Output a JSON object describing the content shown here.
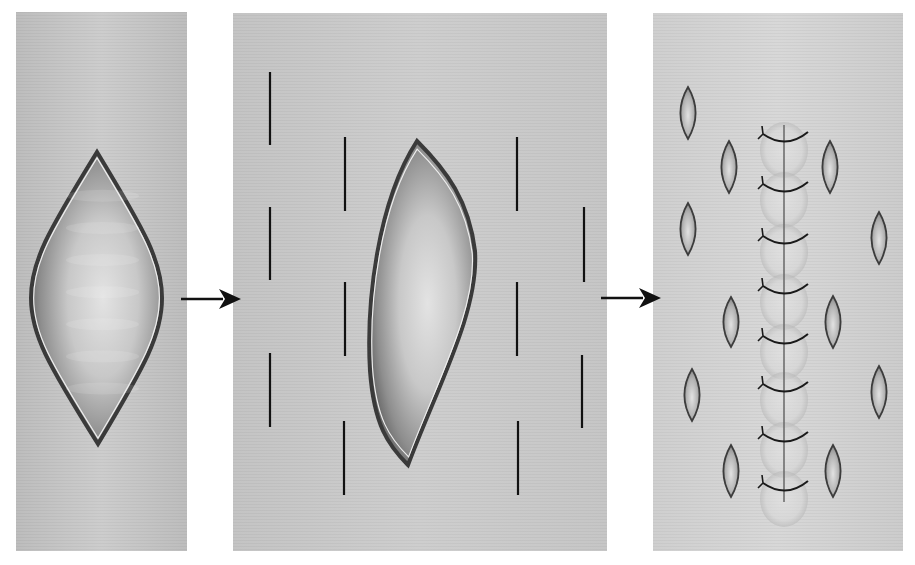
{
  "figure": {
    "colors": {
      "skin": "#c9c9c9",
      "skin_light": "#d3d3d3",
      "wound_edge": "#3a3a3a",
      "wound_inner": "#e0e0e0",
      "incision": "#111111",
      "suture": "#1a1a1a",
      "arrow": "#111111"
    }
  },
  "panels": [
    {
      "id": "step-1",
      "label": "open-wound",
      "x": 16,
      "y": 12,
      "w": 171,
      "h": 539
    },
    {
      "id": "step-2",
      "label": "relaxing-incisions",
      "x": 233,
      "y": 13,
      "w": 374,
      "h": 538
    },
    {
      "id": "step-3",
      "label": "closed-wound",
      "x": 653,
      "y": 13,
      "w": 250,
      "h": 538
    }
  ],
  "arrows": [
    {
      "id": "arrow-1",
      "x1": 181,
      "x2": 241,
      "y": 299
    },
    {
      "id": "arrow-2",
      "x1": 601,
      "x2": 661,
      "y": 298
    }
  ],
  "wound_1": {
    "top": [
      97,
      152
    ],
    "bottom": [
      98,
      444
    ],
    "left": 31,
    "right": 162
  },
  "wound_2": {
    "top": [
      417,
      141
    ],
    "bottom": [
      408,
      465
    ],
    "left": 368,
    "right": 475
  },
  "incisions": [
    {
      "x": 270,
      "y1": 72,
      "y2": 145
    },
    {
      "x": 270,
      "y1": 207,
      "y2": 280
    },
    {
      "x": 270,
      "y1": 353,
      "y2": 427
    },
    {
      "x": 345,
      "y1": 137,
      "y2": 211
    },
    {
      "x": 345,
      "y1": 282,
      "y2": 356
    },
    {
      "x": 344,
      "y1": 421,
      "y2": 495
    },
    {
      "x": 517,
      "y1": 137,
      "y2": 211
    },
    {
      "x": 517,
      "y1": 282,
      "y2": 356
    },
    {
      "x": 518,
      "y1": 421,
      "y2": 495
    },
    {
      "x": 584,
      "y1": 207,
      "y2": 282
    },
    {
      "x": 582,
      "y1": 355,
      "y2": 428
    }
  ],
  "gaped_incisions": [
    {
      "cx": 688,
      "cy": 113,
      "rx": 8,
      "ry": 26
    },
    {
      "cx": 688,
      "cy": 229,
      "rx": 8,
      "ry": 26
    },
    {
      "cx": 692,
      "cy": 395,
      "rx": 8,
      "ry": 26
    },
    {
      "cx": 729,
      "cy": 167,
      "rx": 8,
      "ry": 26
    },
    {
      "cx": 731,
      "cy": 322,
      "rx": 8,
      "ry": 25
    },
    {
      "cx": 731,
      "cy": 471,
      "rx": 8,
      "ry": 26
    },
    {
      "cx": 830,
      "cy": 167,
      "rx": 8,
      "ry": 26
    },
    {
      "cx": 833,
      "cy": 322,
      "rx": 8,
      "ry": 26
    },
    {
      "cx": 833,
      "cy": 471,
      "rx": 8,
      "ry": 26
    },
    {
      "cx": 879,
      "cy": 238,
      "rx": 8,
      "ry": 26
    },
    {
      "cx": 879,
      "cy": 392,
      "rx": 8,
      "ry": 26
    }
  ],
  "suture_line": {
    "x": 784,
    "y1": 125,
    "y2": 502
  },
  "sutures": [
    138,
    188,
    240,
    290,
    340,
    388,
    438,
    487
  ]
}
